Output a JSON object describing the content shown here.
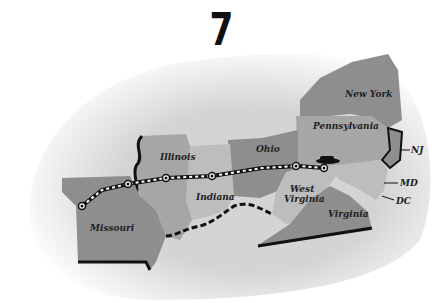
{
  "title": "7",
  "map": {
    "route": {
      "description": "Dashed route line with circular stop markers from Missouri through Illinois, Indiana, Ohio to West Virginia",
      "stops": 6,
      "vehicle_icon": "car-icon"
    },
    "highlighted_states": [
      "Missouri",
      "Illinois",
      "Indiana",
      "Ohio",
      "West Virginia",
      "Virginia",
      "Pennsylvania",
      "New York"
    ],
    "labels": {
      "missouri": "Missouri",
      "illinois": "Illinois",
      "indiana": "Indiana",
      "ohio": "Ohio",
      "west_virginia_1": "West",
      "west_virginia_2": "Virginia",
      "virginia": "Virginia",
      "pennsylvania": "Pennsylvania",
      "new_york": "New York",
      "nj": "NJ",
      "md": "MD",
      "dc": "DC"
    },
    "colors": {
      "background": "#ffffff",
      "land_faded": "#d9d9d9",
      "state_dark": "#8e8e8e",
      "state_mid": "#a6a6a6",
      "state_light": "#bdbdbd",
      "border": "#111111"
    }
  }
}
